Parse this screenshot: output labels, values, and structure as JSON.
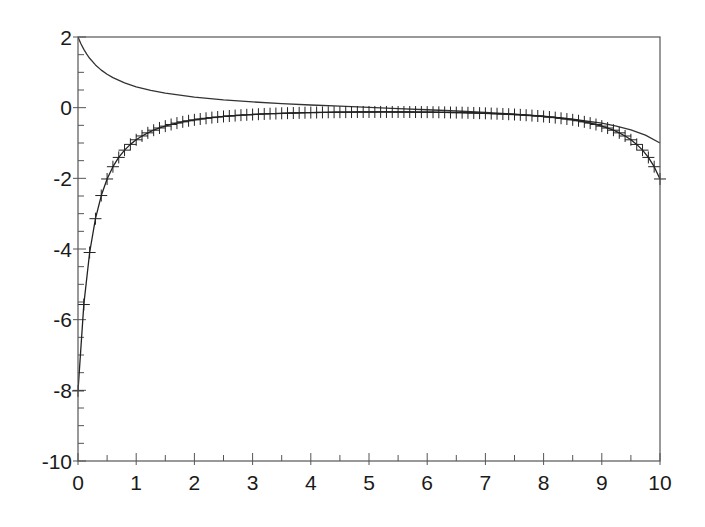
{
  "chart_data": {
    "type": "line",
    "title": "",
    "xlabel": "",
    "ylabel": "",
    "xlim": [
      0,
      10
    ],
    "ylim": [
      -10,
      2
    ],
    "grid": false,
    "legend": null,
    "x_ticks": [
      0,
      1,
      2,
      3,
      4,
      5,
      6,
      7,
      8,
      9,
      10
    ],
    "x_tick_labels": [
      "0",
      "1",
      "2",
      "3",
      "4",
      "5",
      "6",
      "7",
      "8",
      "9",
      "10"
    ],
    "y_ticks": [
      -10,
      -8,
      -6,
      -4,
      -2,
      0,
      2
    ],
    "y_tick_labels": [
      "-10",
      "-8",
      "-6",
      "-4",
      "-2",
      "0",
      "2"
    ],
    "x_minor_step": 0.5,
    "y_minor_step": 0.5,
    "series": [
      {
        "name": "upper-curve",
        "style": "line",
        "color": "#333333",
        "x": [
          0,
          0.05,
          0.1,
          0.15,
          0.2,
          0.3,
          0.4,
          0.5,
          0.6,
          0.8,
          1.0,
          1.25,
          1.5,
          2,
          2.5,
          3,
          3.5,
          4,
          4.5,
          5,
          5.5,
          6,
          6.5,
          7,
          7.5,
          8,
          8.5,
          9,
          9.25,
          9.5,
          9.75,
          10
        ],
        "y": [
          2.0,
          1.809,
          1.649,
          1.514,
          1.398,
          1.21,
          1.063,
          0.945,
          0.849,
          0.7,
          0.59,
          0.487,
          0.409,
          0.298,
          0.221,
          0.163,
          0.116,
          0.076,
          0.041,
          0.008,
          -0.025,
          -0.059,
          -0.094,
          -0.135,
          -0.183,
          -0.243,
          -0.323,
          -0.44,
          -0.521,
          -0.628,
          -0.778,
          -1.0
        ]
      },
      {
        "name": "lower-curve",
        "style": "line+markers",
        "marker": "+",
        "color": "#222222",
        "x_start": 0,
        "x_step": 0.1,
        "y": [
          -8.017,
          -5.572,
          -4.099,
          -3.142,
          -2.487,
          -2.018,
          -1.671,
          -1.408,
          -1.202,
          -1.039,
          -0.909,
          -0.801,
          -0.713,
          -0.638,
          -0.575,
          -0.522,
          -0.476,
          -0.436,
          -0.401,
          -0.371,
          -0.345,
          -0.321,
          -0.3,
          -0.281,
          -0.265,
          -0.249,
          -0.236,
          -0.224,
          -0.212,
          -0.202,
          -0.194,
          -0.185,
          -0.178,
          -0.171,
          -0.166,
          -0.16,
          -0.155,
          -0.151,
          -0.147,
          -0.143,
          -0.139,
          -0.137,
          -0.134,
          -0.131,
          -0.129,
          -0.127,
          -0.126,
          -0.124,
          -0.123,
          -0.123,
          -0.122,
          -0.122,
          -0.121,
          -0.121,
          -0.122,
          -0.122,
          -0.123,
          -0.123,
          -0.124,
          -0.126,
          -0.127,
          -0.129,
          -0.131,
          -0.134,
          -0.137,
          -0.14,
          -0.142,
          -0.146,
          -0.15,
          -0.155,
          -0.16,
          -0.167,
          -0.172,
          -0.179,
          -0.186,
          -0.194,
          -0.203,
          -0.214,
          -0.224,
          -0.236,
          -0.25,
          -0.265,
          -0.282,
          -0.3,
          -0.322,
          -0.345,
          -0.371,
          -0.402,
          -0.437,
          -0.477,
          -0.522,
          -0.576,
          -0.638,
          -0.713,
          -0.802,
          -0.909,
          -1.04,
          -1.202,
          -1.408,
          -1.671,
          -2.018
        ]
      }
    ]
  },
  "layout": {
    "plot_left": 78,
    "plot_right": 660,
    "plot_top": 37,
    "plot_bottom": 461,
    "axis_color": "#555555"
  }
}
